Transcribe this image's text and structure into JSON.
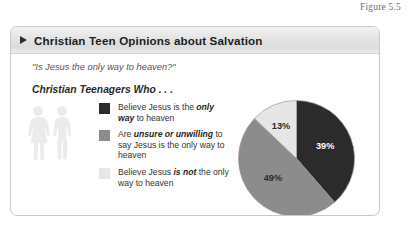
{
  "figure": {
    "caption": "Figure 5.5"
  },
  "panel": {
    "bullet_icon": "triangle-right-icon",
    "title": "Christian Teen Opinions about Salvation",
    "quote": "\"Is Jesus the only way to heaven?\"",
    "lead": "Christian Teenagers Who . . ."
  },
  "people_icons": [
    {
      "name": "female-figure-icon"
    },
    {
      "name": "male-figure-icon"
    }
  ],
  "legend": {
    "items": [
      {
        "color": "#2b2b2b",
        "pre": "Believe Jesus is the ",
        "em": "only way",
        "post": " to heaven"
      },
      {
        "color": "#8c8c8c",
        "pre": "Are ",
        "em": "unsure or unwilling",
        "post": " to say Jesus is the only way to heaven"
      },
      {
        "color": "#e6e6e6",
        "pre": "Believe Jesus ",
        "em": "is not",
        "post": " the only way to heaven"
      }
    ]
  },
  "chart_data": {
    "type": "pie",
    "title": "Christian Teen Opinions about Salvation",
    "subtitle": "\"Is Jesus the only way to heaven?\"",
    "legend_position": "left",
    "grid": false,
    "categories": [
      "Believe Jesus is the only way to heaven",
      "Are unsure or unwilling to say Jesus is the only way to heaven",
      "Believe Jesus is not the only way to heaven"
    ],
    "values": [
      39,
      49,
      13
    ],
    "labels": [
      "39%",
      "49%",
      "13%"
    ],
    "colors": [
      "#2b2b2b",
      "#8c8c8c",
      "#e6e6e6"
    ],
    "label_colors": [
      "#ffffff",
      "#2a2a2a",
      "#2a2a2a"
    ],
    "start_angle_deg": 0,
    "direction": "clockwise",
    "units": "percent"
  }
}
